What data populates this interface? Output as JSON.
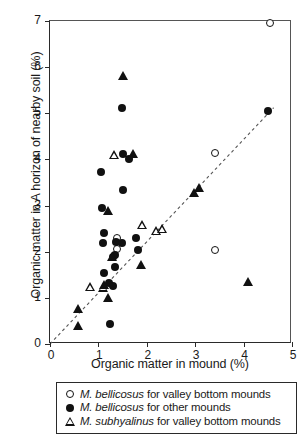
{
  "chart_data": {
    "type": "scatter",
    "title": "",
    "xlabel": "Organic matter in mound (%)",
    "ylabel": "Organic matter in A horizon of nearby soil (%)",
    "xlim": [
      0,
      5
    ],
    "ylim": [
      0,
      7
    ],
    "xticks": [
      0,
      1,
      2,
      3,
      4,
      5
    ],
    "yticks": [
      0,
      1,
      2,
      3,
      4,
      5,
      6,
      7
    ],
    "xtick_labels": [
      "0",
      "1",
      "2",
      "3",
      "4",
      "5"
    ],
    "ytick_labels": [
      "0",
      "1",
      "2",
      "3",
      "4",
      "5",
      "6",
      "7"
    ],
    "grid": false,
    "legend_position": "below-axes",
    "reference_line": {
      "name": "1:1 line",
      "style": "dashed",
      "color": "#555555",
      "x": [
        0,
        4.62
      ],
      "y": [
        0,
        5.12
      ]
    },
    "series": [
      {
        "name": "M. bellicosus for valley bottom mounds",
        "marker": "open-circle",
        "color": "#111111",
        "points": [
          [
            4.55,
            6.95
          ],
          [
            3.4,
            4.13
          ],
          [
            1.38,
            2.3
          ],
          [
            1.38,
            2.05
          ],
          [
            3.4,
            2.04
          ]
        ]
      },
      {
        "name": "M. bellicosus for other mounds",
        "marker": "filled-circle",
        "color": "#111111",
        "points": [
          [
            4.5,
            5.05
          ],
          [
            1.48,
            5.12
          ],
          [
            1.5,
            4.12
          ],
          [
            1.63,
            4.01
          ],
          [
            1.05,
            3.72
          ],
          [
            1.5,
            3.34
          ],
          [
            1.08,
            2.94
          ],
          [
            1.12,
            2.41
          ],
          [
            1.1,
            2.19
          ],
          [
            1.78,
            2.3
          ],
          [
            1.36,
            2.21
          ],
          [
            1.48,
            2.18
          ],
          [
            1.82,
            2.04
          ],
          [
            1.35,
            1.93
          ],
          [
            1.3,
            1.88
          ],
          [
            1.12,
            1.54
          ],
          [
            1.35,
            1.66
          ],
          [
            1.22,
            1.33
          ],
          [
            1.3,
            1.26
          ],
          [
            1.23,
            0.43
          ]
        ]
      },
      {
        "name": "M. subhyalinus for valley bottom mounds",
        "marker": "open-triangle",
        "color": "#111111",
        "points": [
          [
            1.33,
            4.1
          ],
          [
            1.9,
            2.58
          ],
          [
            2.2,
            2.46
          ],
          [
            2.32,
            2.5
          ],
          [
            0.82,
            1.24
          ],
          [
            1.1,
            1.23
          ]
        ]
      },
      {
        "name": "M. subhyalinus for other mounds",
        "marker": "filled-triangle",
        "color": "#111111",
        "points": [
          [
            1.5,
            5.82
          ],
          [
            1.72,
            4.12
          ],
          [
            3.08,
            3.4
          ],
          [
            2.98,
            3.28
          ],
          [
            1.2,
            2.89
          ],
          [
            1.28,
            1.9
          ],
          [
            1.88,
            1.72
          ],
          [
            1.2,
            1.0
          ],
          [
            1.12,
            1.28
          ],
          [
            0.58,
            0.78
          ],
          [
            0.58,
            0.4
          ],
          [
            4.1,
            1.36
          ]
        ]
      }
    ]
  },
  "legend": {
    "entries": [
      {
        "marker": "open-circle",
        "species": "M. bellicosus",
        "rest": " for valley bottom mounds"
      },
      {
        "marker": "filled-circle",
        "species": "M. bellicosus",
        "rest": " for other mounds"
      },
      {
        "marker": "open-triangle",
        "species": "M. subhyalinus",
        "rest": " for valley bottom mounds"
      }
    ]
  }
}
